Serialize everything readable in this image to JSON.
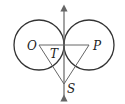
{
  "diagram": {
    "type": "geometry",
    "labels": {
      "O": "O",
      "P": "P",
      "T": "T",
      "S": "S"
    },
    "colors": {
      "stroke": "#333333",
      "gray_line": "#777777",
      "background": "#ffffff"
    },
    "geometry": {
      "circle_radius": 25,
      "center_O": [
        39,
        45
      ],
      "center_P": [
        89,
        45
      ],
      "tangent_point_T": [
        64,
        45
      ],
      "point_S": [
        64,
        84
      ],
      "tangent_line_top": [
        64,
        6
      ],
      "tangent_line_bottom": [
        64,
        100
      ]
    }
  }
}
